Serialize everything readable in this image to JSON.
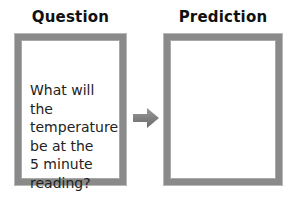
{
  "question": {
    "title": "Question",
    "text": "What will the\ntemperature\nbe at the\n5 minute\nreading?"
  },
  "prediction": {
    "title": "Prediction",
    "text": ""
  },
  "arrow": {
    "icon": "right-arrow-icon",
    "color": "#7a7a7a"
  },
  "colors": {
    "border": "#8a8a8a",
    "background": "#ffffff"
  }
}
